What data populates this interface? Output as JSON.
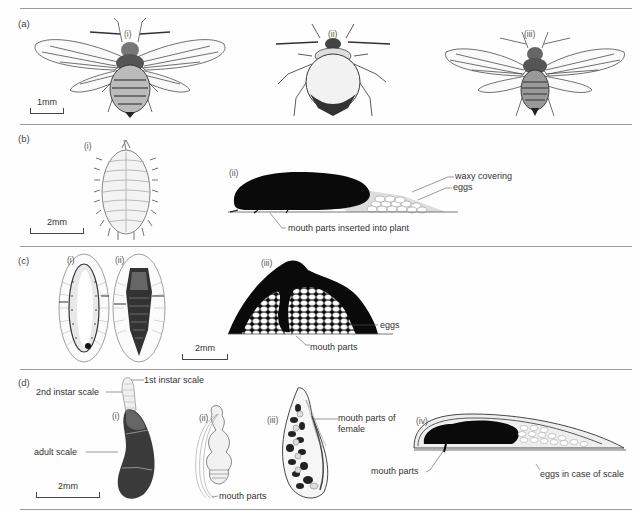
{
  "figure": {
    "panels": [
      {
        "label": "(a)",
        "parts": [
          {
            "label": "(i)",
            "subject": "winged aphid"
          },
          {
            "label": "(ii)",
            "subject": "wingless aphid"
          },
          {
            "label": "(iii)",
            "subject": "winged aphid"
          }
        ],
        "scale_bar": "1mm"
      },
      {
        "label": "(b)",
        "parts": [
          {
            "label": "(i)",
            "subject": "mealybug dorsal view"
          },
          {
            "label": "(ii)",
            "subject": "mealybug side view silhouette"
          }
        ],
        "scale_bar": "2mm",
        "annotations": [
          "waxy covering",
          "eggs",
          "mouth parts inserted into plant"
        ]
      },
      {
        "label": "(c)",
        "parts": [
          {
            "label": "(i)",
            "subject": "soft scale dorsal view"
          },
          {
            "label": "(ii)",
            "subject": "soft scale ventral view"
          },
          {
            "label": "(iii)",
            "subject": "soft scale section over eggs"
          }
        ],
        "scale_bar": "2mm",
        "annotations": [
          "eggs",
          "mouth parts"
        ]
      },
      {
        "label": "(d)",
        "parts": [
          {
            "label": "(i)",
            "subject": "armoured scale"
          },
          {
            "label": "(ii)",
            "subject": "female insect"
          },
          {
            "label": "(iii)",
            "subject": "female under scale"
          },
          {
            "label": "(iv)",
            "subject": "section of scale"
          }
        ],
        "scale_bar": "2mm",
        "annotations": [
          "1st instar scale",
          "2nd instar scale",
          "adult scale",
          "mouth parts",
          "mouth parts of female",
          "mouth parts",
          "eggs in case of scale"
        ]
      }
    ]
  }
}
